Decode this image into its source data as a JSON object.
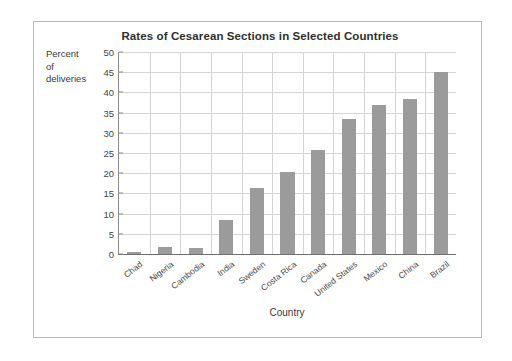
{
  "figure": {
    "title": "Rates of Cesarean Sections in Selected Countries",
    "x_axis_title": "Country",
    "y_axis_caption_line1": "Percent",
    "y_axis_caption_line2": "of",
    "y_axis_caption_line3": "deliveries",
    "bar_color": "#9b9b9b",
    "grid_color": "#d4d4d4",
    "axis_color": "#8b8b8b",
    "frame_color": "#b9b9b9"
  },
  "chart_data": {
    "type": "bar",
    "title": "Rates of Cesarean Sections in Selected Countries",
    "xlabel": "Country",
    "ylabel": "Percent of deliveries",
    "ylim": [
      0,
      50
    ],
    "ytick_step": 5,
    "yticks": [
      0,
      5,
      10,
      15,
      20,
      25,
      30,
      35,
      40,
      45,
      50
    ],
    "ytick_labels": [
      "0",
      "5",
      "10",
      "15",
      "20",
      "25",
      "30",
      "35",
      "40",
      "45",
      "50"
    ],
    "grid": true,
    "legend": false,
    "categories": [
      "Chad",
      "Nigeria",
      "Cambodia",
      "India",
      "Sweden",
      "Costa Rica",
      "Canada",
      "United States",
      "Mexico",
      "China",
      "Brazil"
    ],
    "values": [
      0.4,
      1.8,
      1.6,
      8.3,
      16.4,
      20.4,
      25.7,
      33.4,
      37.0,
      38.4,
      45.0
    ]
  }
}
